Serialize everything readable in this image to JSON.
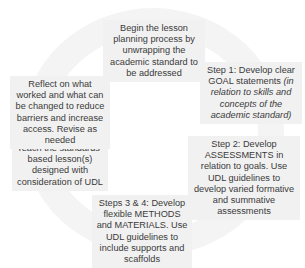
{
  "diagram": {
    "type": "cycle",
    "nodes": [
      {
        "id": "start",
        "text": "Begin the lesson planning process by unwrapping the academic standard to be addressed"
      },
      {
        "id": "step1",
        "text": "Step 1: Develop clear GOAL statements ",
        "italic": "(in relation to skills and concepts of the academic standard)"
      },
      {
        "id": "step2",
        "text": "Step 2: Develop ASSESSMENTS in relation to goals. Use UDL guidelines to develop varied formative and summative assessments"
      },
      {
        "id": "step34",
        "text": "Steps 3 & 4: Develop flexible METHODS and MATERIALS. Use UDL guidelines to include supports and scaffolds"
      },
      {
        "id": "teach",
        "text": "Teach the standards-based lesson(s) designed with consideration of UDL"
      },
      {
        "id": "reflect",
        "text": "Reflect on what worked and what can be changed to reduce barriers and increase access. Revise as needed"
      }
    ],
    "colors": {
      "ring": "#f4f4f4",
      "box": "#f1f1f1",
      "text": "#3a3a3a"
    }
  }
}
